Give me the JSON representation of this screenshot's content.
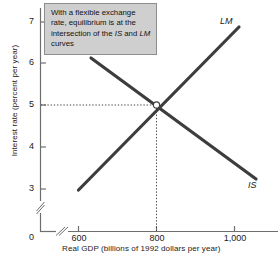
{
  "figure": {
    "annotation": {
      "text": "With a flexible exchange rate, equilibrium is at the intersection of the IS and LM curves",
      "segments": [
        {
          "text": "With a flexible exchange rate, equilibrium is at the intersection of the ",
          "italic": false
        },
        {
          "text": "IS",
          "italic": true
        },
        {
          "text": " and ",
          "italic": false
        },
        {
          "text": "LM",
          "italic": true
        },
        {
          "text": " curves",
          "italic": false
        }
      ],
      "background_color": "#cfcfcf",
      "border_color": "#8d8d8d"
    }
  },
  "chart_data": {
    "type": "line",
    "title": "",
    "xlabel": "Real GDP  (billions of 1992 dollars per year)",
    "ylabel": "Interest rate (percent per year)",
    "xlim": [
      540,
      1080
    ],
    "ylim": [
      2.6,
      7.4
    ],
    "x_ticks": [
      600,
      800,
      1000
    ],
    "x_tick_labels": [
      "600",
      "800",
      "1,000"
    ],
    "y_ticks": [
      3,
      4,
      5,
      6,
      7
    ],
    "y_tick_labels": [
      "3",
      "4",
      "5",
      "6",
      "7"
    ],
    "origin_label": "0",
    "axis_break_x": true,
    "axis_break_y": true,
    "grid": false,
    "legend_position": "inline-curve-labels",
    "curve_color": "#3d3d3d",
    "series": [
      {
        "name": "LM",
        "label": "LM",
        "x": [
          600,
          1012
        ],
        "y": [
          2.97,
          6.85
        ],
        "slope_sign": "positive"
      },
      {
        "name": "IS",
        "label": "IS",
        "x": [
          632,
          1056
        ],
        "y": [
          6.13,
          3.24
        ],
        "slope_sign": "negative"
      }
    ],
    "equilibrium": {
      "label": "equilibrium",
      "x": 800,
      "y": 5,
      "marker": "open-circle",
      "guide_lines": "dotted"
    },
    "annotations": [
      {
        "text": "LM",
        "x": 1012,
        "y": 6.85,
        "italic": true
      },
      {
        "text": "IS",
        "x": 1056,
        "y": 3.24,
        "italic": true
      }
    ]
  }
}
